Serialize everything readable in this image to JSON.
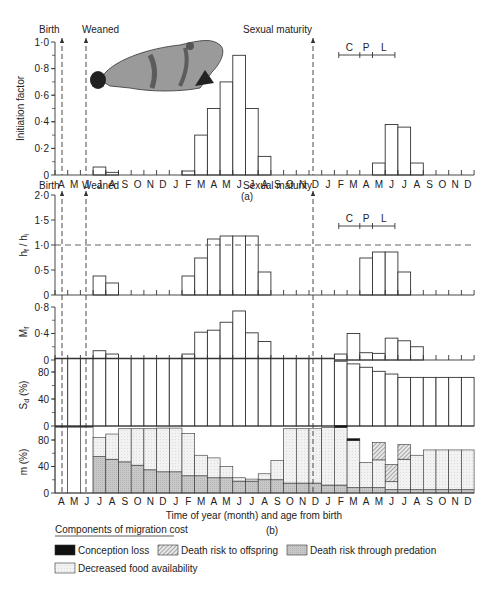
{
  "months": [
    "A",
    "M",
    "J",
    "J",
    "A",
    "S",
    "O",
    "N",
    "D",
    "J",
    "F",
    "M",
    "A",
    "M",
    "J",
    "J",
    "A",
    "S",
    "O",
    "N",
    "D",
    "J",
    "F",
    "M",
    "A",
    "M",
    "J",
    "J",
    "A",
    "S",
    "O",
    "N",
    "D"
  ],
  "annotations": {
    "birth": "Birth",
    "weaned": "Weaned",
    "sexual_maturity": "Sexual maturity",
    "phases": [
      "C",
      "P",
      "L"
    ],
    "panel_a_label": "(a)",
    "panel_b_label": "(b)",
    "xlabel": "Time of year (month) and age from birth"
  },
  "legend": {
    "title": "Components of migration cost",
    "items": [
      {
        "label": "Conception loss",
        "pattern": "solid-black"
      },
      {
        "label": "Death risk to offspring",
        "pattern": "hatched"
      },
      {
        "label": "Death risk through predation",
        "pattern": "grey"
      },
      {
        "label": "Decreased food availability",
        "pattern": "light-stipple"
      }
    ]
  },
  "colors": {
    "line": "#333333",
    "predation": "#c8c8c8",
    "food": "#f2f2f2",
    "conception": "#111111",
    "hatch": "#777777"
  },
  "chart_data": [
    {
      "type": "bar",
      "panel": "a",
      "title": "",
      "ylabel": "Initiation factor",
      "xlabel": "",
      "ylim": [
        0,
        1.0
      ],
      "yticks": [
        "0",
        "0·2",
        "0·4",
        "0·6",
        "0·8",
        "1·0"
      ],
      "categories": [
        "A",
        "M",
        "J",
        "J",
        "A",
        "S",
        "O",
        "N",
        "D",
        "J",
        "F",
        "M",
        "A",
        "M",
        "J",
        "J",
        "A",
        "S",
        "O",
        "N",
        "D",
        "J",
        "F",
        "M",
        "A",
        "M",
        "J",
        "J",
        "A",
        "S",
        "O",
        "N",
        "D"
      ],
      "values": [
        0,
        0,
        0,
        0.06,
        0.02,
        0,
        0,
        0,
        0,
        0,
        0.03,
        0.3,
        0.5,
        0.7,
        0.9,
        0.5,
        0.14,
        0,
        0,
        0,
        0,
        0,
        0,
        0,
        0,
        0.09,
        0.38,
        0.36,
        0.09,
        0,
        0,
        0,
        0
      ]
    },
    {
      "type": "bar",
      "panel": "b1",
      "ylabel": "h_f / h_i",
      "ylim": [
        0,
        2.0
      ],
      "yticks": [
        "0",
        "0·5",
        "1·0",
        "1·5",
        "2·0"
      ],
      "reference_line": 1.0,
      "values": [
        0,
        0,
        0,
        0.38,
        0.24,
        0,
        0,
        0,
        0,
        0,
        0.38,
        0.74,
        1.12,
        1.18,
        1.18,
        1.18,
        0.46,
        0,
        0,
        0,
        0,
        0,
        0,
        0,
        0.74,
        0.86,
        0.86,
        0.46,
        0,
        0,
        0,
        0,
        0
      ]
    },
    {
      "type": "bar",
      "panel": "b2",
      "ylabel": "M_f",
      "ylim": [
        0,
        0.8
      ],
      "yticks": [
        "0",
        "0·4",
        "0·8"
      ],
      "values": [
        0,
        0,
        0,
        0.14,
        0.09,
        0,
        0,
        0,
        0,
        0,
        0.09,
        0.42,
        0.45,
        0.57,
        0.74,
        0.41,
        0.28,
        0,
        0,
        0,
        0,
        0,
        0.09,
        0.4,
        0.11,
        0.1,
        0.33,
        0.29,
        0.2,
        0,
        0,
        0,
        0
      ]
    },
    {
      "type": "bar",
      "panel": "b3",
      "ylabel": "S_d (%)",
      "ylim": [
        0,
        100
      ],
      "yticks": [
        "0",
        "40",
        "80"
      ],
      "values": [
        100,
        100,
        100,
        100,
        100,
        100,
        100,
        100,
        100,
        100,
        100,
        100,
        100,
        100,
        100,
        100,
        100,
        100,
        100,
        100,
        100,
        100,
        96,
        92,
        87,
        81,
        77,
        72,
        72,
        72,
        72,
        72,
        72
      ]
    },
    {
      "type": "stacked-bar",
      "panel": "b4",
      "ylabel": "m (%)",
      "ylim": [
        0,
        100
      ],
      "yticks": [
        "0",
        "40",
        "80"
      ],
      "series": [
        {
          "name": "Death risk through predation",
          "values": [
            0,
            0,
            0,
            55,
            51,
            47,
            42,
            35,
            32,
            32,
            26,
            26,
            23,
            23,
            18,
            18,
            20,
            20,
            15,
            15,
            15,
            12,
            12,
            8,
            8,
            8,
            5,
            5,
            5,
            5,
            5,
            5,
            5
          ]
        },
        {
          "name": "Decreased food availability",
          "values": [
            100,
            100,
            100,
            29,
            38,
            50,
            55,
            62,
            66,
            66,
            64,
            31,
            30,
            17,
            5,
            3,
            9,
            29,
            82,
            82,
            82,
            87,
            87,
            71,
            38,
            42,
            12,
            46,
            52,
            60,
            60,
            60,
            60
          ]
        },
        {
          "name": "Death risk to offspring",
          "values": [
            0,
            0,
            0,
            0,
            0,
            0,
            0,
            0,
            0,
            0,
            0,
            0,
            0,
            0,
            0,
            0,
            0,
            0,
            0,
            0,
            0,
            0,
            0,
            0,
            0,
            26,
            26,
            22,
            0,
            0,
            0,
            0,
            0
          ]
        },
        {
          "name": "Conception loss",
          "values": [
            0,
            0,
            0,
            0,
            0,
            0,
            0,
            0,
            0,
            0,
            0,
            0,
            0,
            0,
            0,
            0,
            0,
            0,
            0,
            0,
            0,
            0,
            3,
            3,
            0,
            0,
            0,
            0,
            0,
            0,
            0,
            0,
            0
          ]
        }
      ],
      "totals": [
        100,
        100,
        100,
        84,
        89,
        97,
        97,
        97,
        98,
        98,
        90,
        57,
        53,
        40,
        23,
        21,
        29,
        49,
        97,
        97,
        97,
        99,
        99,
        82,
        46,
        76,
        43,
        73,
        57,
        65,
        65,
        65,
        65
      ]
    }
  ]
}
